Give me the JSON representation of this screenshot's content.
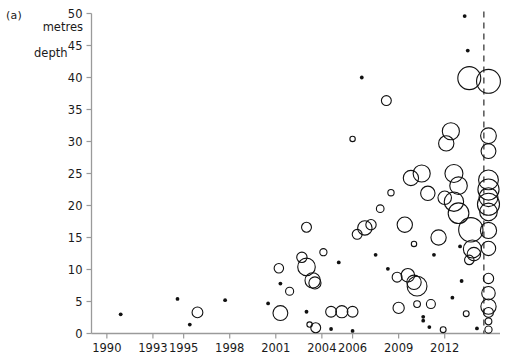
{
  "figure": {
    "panel_label": "(a)",
    "y_axis_title_line1": "metres",
    "y_axis_title_line2": "depth"
  },
  "chart_data": {
    "type": "scatter",
    "title": "",
    "subtitle": "",
    "xlabel": "",
    "ylabel": "metres depth",
    "panel": "(a)",
    "grid": false,
    "legend": "none",
    "xlim": [
      1989.0,
      2015.6
    ],
    "ylim": [
      0,
      50
    ],
    "x_ticks": [
      1990,
      1993,
      1995,
      1998,
      2001,
      2004,
      2006,
      2009,
      2012
    ],
    "x_tick_labels": [
      "1990",
      "1993",
      "1995",
      "1998",
      "2001",
      "2004",
      "2006",
      "2009",
      "2012"
    ],
    "y_ticks": [
      0,
      5,
      10,
      15,
      20,
      25,
      30,
      35,
      40,
      45,
      50
    ],
    "y_tick_labels": [
      "0",
      "5",
      "10",
      "15",
      "20",
      "25",
      "30",
      "35",
      "40",
      "45",
      "50"
    ],
    "marker_style": "open-circle",
    "size_encodes": "bubble area",
    "annotations": [
      {
        "type": "vertical-dashed-line",
        "x": 2014.55,
        "label": ""
      }
    ],
    "series": [
      {
        "name": "dive records",
        "x_label": "year",
        "y_label": "metres depth",
        "size_label": "relative magnitude",
        "points": [
          {
            "x": 1990.9,
            "y": 3.0,
            "size": 1.0
          },
          {
            "x": 1994.6,
            "y": 5.4,
            "size": 1.0
          },
          {
            "x": 1995.4,
            "y": 1.4,
            "size": 1.0
          },
          {
            "x": 1995.9,
            "y": 3.3,
            "size": 2.4
          },
          {
            "x": 1997.7,
            "y": 5.2,
            "size": 1.0
          },
          {
            "x": 2000.5,
            "y": 4.7,
            "size": 1.0
          },
          {
            "x": 2001.2,
            "y": 10.2,
            "size": 2.1
          },
          {
            "x": 2001.3,
            "y": 7.8,
            "size": 1.0
          },
          {
            "x": 2001.9,
            "y": 6.6,
            "size": 1.8
          },
          {
            "x": 2001.3,
            "y": 3.2,
            "size": 3.3
          },
          {
            "x": 2002.7,
            "y": 11.9,
            "size": 2.3
          },
          {
            "x": 2003.0,
            "y": 10.4,
            "size": 3.9
          },
          {
            "x": 2003.6,
            "y": 0.9,
            "size": 2.2
          },
          {
            "x": 2003.4,
            "y": 8.3,
            "size": 3.4
          },
          {
            "x": 2003.55,
            "y": 7.9,
            "size": 2.7
          },
          {
            "x": 2003.0,
            "y": 16.6,
            "size": 2.2
          },
          {
            "x": 2003.2,
            "y": 1.4,
            "size": 1.2
          },
          {
            "x": 2003.0,
            "y": 3.4,
            "size": 1.0
          },
          {
            "x": 2004.1,
            "y": 12.7,
            "size": 1.6
          },
          {
            "x": 2004.6,
            "y": 0.7,
            "size": 1.0
          },
          {
            "x": 2004.6,
            "y": 3.4,
            "size": 2.4
          },
          {
            "x": 2005.3,
            "y": 3.4,
            "size": 2.7
          },
          {
            "x": 2005.1,
            "y": 11.1,
            "size": 1.0
          },
          {
            "x": 2006.0,
            "y": 0.4,
            "size": 1.0
          },
          {
            "x": 2006.0,
            "y": 3.4,
            "size": 2.4
          },
          {
            "x": 2006.3,
            "y": 15.5,
            "size": 2.2
          },
          {
            "x": 2006.0,
            "y": 30.4,
            "size": 1.2
          },
          {
            "x": 2006.6,
            "y": 40.0,
            "size": 1.0
          },
          {
            "x": 2006.8,
            "y": 16.5,
            "size": 3.2
          },
          {
            "x": 2007.2,
            "y": 17.0,
            "size": 2.3
          },
          {
            "x": 2007.5,
            "y": 12.3,
            "size": 1.0
          },
          {
            "x": 2007.8,
            "y": 19.5,
            "size": 1.7
          },
          {
            "x": 2008.2,
            "y": 36.4,
            "size": 2.2
          },
          {
            "x": 2008.3,
            "y": 10.1,
            "size": 1.0
          },
          {
            "x": 2008.5,
            "y": 22.0,
            "size": 1.4
          },
          {
            "x": 2008.9,
            "y": 8.8,
            "size": 2.2
          },
          {
            "x": 2009.0,
            "y": 4.0,
            "size": 2.5
          },
          {
            "x": 2009.4,
            "y": 17.0,
            "size": 3.4
          },
          {
            "x": 2009.6,
            "y": 9.1,
            "size": 3.0
          },
          {
            "x": 2009.8,
            "y": 24.3,
            "size": 3.4
          },
          {
            "x": 2010.0,
            "y": 8.0,
            "size": 3.2
          },
          {
            "x": 2010.2,
            "y": 7.4,
            "size": 4.4
          },
          {
            "x": 2010.6,
            "y": 2.6,
            "size": 1.0
          },
          {
            "x": 2010.6,
            "y": 2.0,
            "size": 1.0
          },
          {
            "x": 2010.2,
            "y": 4.6,
            "size": 1.5
          },
          {
            "x": 2010.0,
            "y": 14.0,
            "size": 1.2
          },
          {
            "x": 2010.5,
            "y": 25.0,
            "size": 3.8
          },
          {
            "x": 2010.9,
            "y": 21.9,
            "size": 3.2
          },
          {
            "x": 2011.0,
            "y": 1.0,
            "size": 1.0
          },
          {
            "x": 2011.3,
            "y": 12.3,
            "size": 1.0
          },
          {
            "x": 2011.1,
            "y": 4.6,
            "size": 2.0
          },
          {
            "x": 2011.6,
            "y": 15.0,
            "size": 3.4
          },
          {
            "x": 2011.9,
            "y": 0.6,
            "size": 1.3
          },
          {
            "x": 2012.1,
            "y": 29.7,
            "size": 3.4
          },
          {
            "x": 2012.4,
            "y": 31.6,
            "size": 3.8
          },
          {
            "x": 2012.0,
            "y": 21.2,
            "size": 3.0
          },
          {
            "x": 2012.6,
            "y": 20.6,
            "size": 4.3
          },
          {
            "x": 2012.6,
            "y": 25.0,
            "size": 4.0
          },
          {
            "x": 2012.9,
            "y": 18.8,
            "size": 4.6
          },
          {
            "x": 2012.9,
            "y": 23.1,
            "size": 3.9
          },
          {
            "x": 2012.5,
            "y": 5.6,
            "size": 1.0
          },
          {
            "x": 2013.0,
            "y": 13.6,
            "size": 1.0
          },
          {
            "x": 2013.1,
            "y": 8.2,
            "size": 1.0
          },
          {
            "x": 2013.3,
            "y": 49.6,
            "size": 1.0
          },
          {
            "x": 2013.5,
            "y": 44.2,
            "size": 1.0
          },
          {
            "x": 2013.6,
            "y": 39.9,
            "size": 5.1
          },
          {
            "x": 2013.7,
            "y": 16.2,
            "size": 5.4
          },
          {
            "x": 2013.8,
            "y": 13.2,
            "size": 4.0
          },
          {
            "x": 2013.9,
            "y": 12.4,
            "size": 3.0
          },
          {
            "x": 2013.6,
            "y": 11.5,
            "size": 2.1
          },
          {
            "x": 2013.4,
            "y": 3.1,
            "size": 1.3
          },
          {
            "x": 2014.1,
            "y": 0.8,
            "size": 1.0
          },
          {
            "x": 2014.85,
            "y": 39.4,
            "size": 5.3
          },
          {
            "x": 2014.85,
            "y": 30.9,
            "size": 3.5
          },
          {
            "x": 2014.85,
            "y": 28.5,
            "size": 3.3
          },
          {
            "x": 2014.85,
            "y": 24.0,
            "size": 4.4
          },
          {
            "x": 2014.85,
            "y": 22.5,
            "size": 4.7
          },
          {
            "x": 2014.85,
            "y": 21.3,
            "size": 4.2
          },
          {
            "x": 2014.85,
            "y": 20.2,
            "size": 4.9
          },
          {
            "x": 2014.85,
            "y": 19.0,
            "size": 3.9
          },
          {
            "x": 2014.85,
            "y": 16.1,
            "size": 3.6
          },
          {
            "x": 2014.85,
            "y": 13.3,
            "size": 3.2
          },
          {
            "x": 2014.85,
            "y": 8.6,
            "size": 2.3
          },
          {
            "x": 2014.85,
            "y": 6.3,
            "size": 3.0
          },
          {
            "x": 2014.85,
            "y": 4.2,
            "size": 3.4
          },
          {
            "x": 2014.85,
            "y": 3.3,
            "size": 2.2
          },
          {
            "x": 2014.85,
            "y": 1.9,
            "size": 1.5
          },
          {
            "x": 2014.85,
            "y": 0.6,
            "size": 1.6
          }
        ]
      }
    ]
  }
}
